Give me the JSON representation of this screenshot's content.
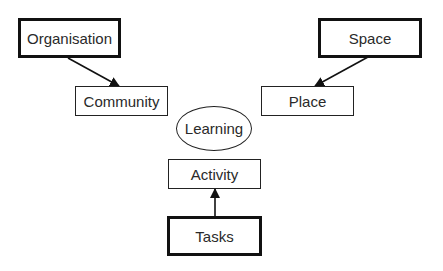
{
  "diagram": {
    "nodes": [
      {
        "id": "organisation",
        "label": "Organisation",
        "shape": "rect",
        "border": "thick"
      },
      {
        "id": "community",
        "label": "Community",
        "shape": "rect",
        "border": "thin"
      },
      {
        "id": "space",
        "label": "Space",
        "shape": "rect",
        "border": "thick"
      },
      {
        "id": "place",
        "label": "Place",
        "shape": "rect",
        "border": "thin"
      },
      {
        "id": "learning",
        "label": "Learning",
        "shape": "ellipse",
        "border": "thin"
      },
      {
        "id": "activity",
        "label": "Activity",
        "shape": "rect",
        "border": "thin"
      },
      {
        "id": "tasks",
        "label": "Tasks",
        "shape": "rect",
        "border": "thick"
      }
    ],
    "edges": [
      {
        "from": "organisation",
        "to": "community"
      },
      {
        "from": "space",
        "to": "place"
      },
      {
        "from": "tasks",
        "to": "activity"
      }
    ]
  }
}
